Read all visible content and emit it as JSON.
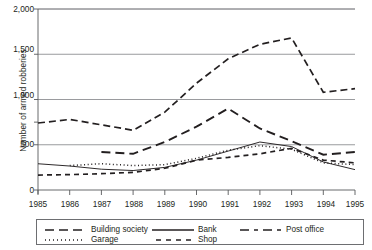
{
  "chart_data": {
    "type": "line",
    "title": "",
    "xlabel": "",
    "ylabel": "Number of armed robberies",
    "categories": [
      "1985",
      "1986",
      "1987",
      "1988",
      "1989",
      "1990",
      "1991",
      "1992",
      "1993",
      "1994",
      "1995"
    ],
    "x": [
      1985,
      1986,
      1987,
      1988,
      1989,
      1990,
      1991,
      1992,
      1993,
      1994,
      1995
    ],
    "xlim": [
      1985,
      1995
    ],
    "ylim": [
      0,
      2000
    ],
    "yticks": [
      0,
      500,
      1000,
      1500,
      2000
    ],
    "ytick_labels": [
      "0",
      "500",
      "1,000",
      "1,500",
      "2,000"
    ],
    "grid": true,
    "grid_axis": "y",
    "legend_position": "bottom",
    "series": [
      {
        "name": "Building society",
        "dash": "long-dash",
        "values": [
          null,
          null,
          420,
          400,
          530,
          700,
          900,
          680,
          540,
          390,
          420
        ]
      },
      {
        "name": "Bank",
        "dash": "solid",
        "values": [
          290,
          265,
          230,
          215,
          250,
          330,
          430,
          530,
          480,
          310,
          225
        ]
      },
      {
        "name": "Post office",
        "dash": "dash-dot-long",
        "values": [
          740,
          780,
          720,
          660,
          860,
          1180,
          1450,
          1610,
          1680,
          1080,
          1120
        ]
      },
      {
        "name": "Garage",
        "dash": "dotted",
        "values": [
          null,
          270,
          290,
          270,
          280,
          350,
          440,
          490,
          450,
          300,
          280
        ]
      },
      {
        "name": "Shop",
        "dash": "dashed",
        "values": [
          165,
          170,
          180,
          195,
          240,
          330,
          360,
          400,
          460,
          330,
          300
        ]
      }
    ]
  },
  "axis": {
    "ylabel": "Number of armed robberies",
    "yticks": [
      "2,000",
      "1,500",
      "1,000",
      "500",
      "0"
    ],
    "xticks": [
      "1985",
      "1986",
      "1987",
      "1988",
      "1989",
      "1990",
      "1991",
      "1992",
      "1993",
      "1994",
      "1995"
    ]
  },
  "legend": {
    "items": [
      {
        "label": "Building society",
        "style": "long-dash"
      },
      {
        "label": "Bank",
        "style": "solid"
      },
      {
        "label": "Post office",
        "style": "dash-dot-long"
      },
      {
        "label": "Garage",
        "style": "dotted"
      },
      {
        "label": "Shop",
        "style": "dashed"
      }
    ]
  },
  "colors": {
    "line": "#231f20",
    "grid": "#808285",
    "axis": "#58595b",
    "background": "#ffffff"
  }
}
